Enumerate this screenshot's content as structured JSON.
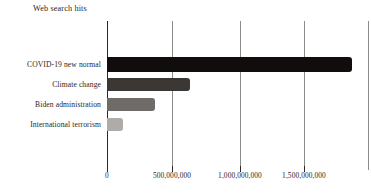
{
  "chart_data": {
    "type": "bar",
    "orientation": "horizontal",
    "title": "Web search hits",
    "xlabel": "",
    "ylabel": "",
    "categories": [
      "COVID-19 new normal",
      "Climate change",
      "Biden administration",
      "International terrorism"
    ],
    "values": [
      1880000000,
      635000000,
      370000000,
      120000000
    ],
    "bar_colors": [
      "#100d0c",
      "#3a3735",
      "#6e6b68",
      "#aeabA8"
    ],
    "xlim": [
      0,
      2030000000
    ],
    "xticks": [
      0,
      500000000,
      1000000000,
      1500000000
    ],
    "xtick_labels": [
      "0",
      "500,000,000",
      "1,000,000,000",
      "1,500,000,000"
    ],
    "gridlines": [
      500000000,
      1000000000,
      1500000000,
      2000000000
    ],
    "grid": true,
    "legend": false,
    "axis_color": "#2b2725",
    "grid_color": "#8e8a87",
    "background": "#ffffff"
  },
  "bars": [
    {
      "label": "COVID-19 new normal",
      "value": 1880000000,
      "color": "#100d0c",
      "width_px": 245
    },
    {
      "label": "Climate change",
      "value": 635000000,
      "color": "#3a3735",
      "width_px": 83
    },
    {
      "label": "Biden administration",
      "value": 370000000,
      "color": "#6e6b68",
      "width_px": 48
    },
    {
      "label": "International terrorism",
      "value": 120000000,
      "color": "#aeaba8",
      "width_px": 16
    }
  ],
  "gridlines_px": [
    172,
    240,
    304,
    368
  ],
  "ticks_px": [
    107,
    172,
    240,
    304
  ]
}
